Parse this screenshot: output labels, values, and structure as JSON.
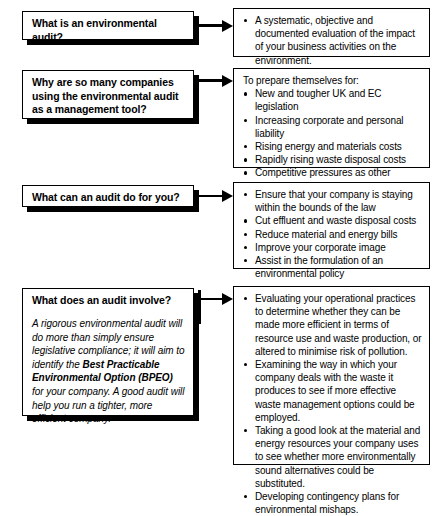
{
  "document": {
    "title": "Environmental audit question and answer flow chart",
    "background_color": "#ffffff",
    "ink_color": "#000000"
  },
  "sections": [
    {
      "id": "what-is-an-environmental-audit",
      "question": {
        "title": "What is an environmental audit?",
        "body": ""
      },
      "arrow": {
        "name": "connector-arrow-1"
      },
      "answer": {
        "lead": "",
        "items": [
          "A systematic, objective and documented evaluation of the impact of your business activities on the environment."
        ]
      }
    },
    {
      "id": "why-are-so-many-companies",
      "question": {
        "title": "Why are so many companies\nusing the environmental audit\nas a management tool?",
        "body": ""
      },
      "arrow": {
        "name": "connector-arrow-2"
      },
      "answer": {
        "lead": "To prepare themselves for:",
        "items": [
          "New and tougher UK and EC legislation",
          "Increasing corporate and personal liability",
          "Rising energy and materials costs",
          "Rapidly rising waste disposal costs",
          "Competitive pressures as other companies clean up their act",
          "Growing public pressure"
        ]
      }
    },
    {
      "id": "what-can-an-audit-do-for-you",
      "question": {
        "title": "What can an audit do for you?",
        "body": ""
      },
      "arrow": {
        "name": "connector-arrow-3"
      },
      "answer": {
        "lead": "",
        "items": [
          "Ensure that your company is staying within the bounds of the law",
          "Cut effluent and waste disposal costs",
          "Reduce material and energy bills",
          "Improve your corporate image",
          "Assist in the formulation of an environmental policy"
        ]
      }
    },
    {
      "id": "what-does-an-audit-involve",
      "question": {
        "title": "What does an audit involve?",
        "body_prefix": "A rigorous environmental audit will do more than simply ensure legislative compliance; it will aim to identify the ",
        "body_emphasis": "Best Practicable Environmental Option (BPEO)",
        "body_suffix": " for your company.  A good audit will help you run a tighter, more efficient company."
      },
      "arrow": {
        "name": "connector-arrow-4"
      },
      "answer": {
        "lead": "",
        "items": [
          "Evaluating your operational practices to determine whether they can be made more efficient in terms of resource use and waste production, or altered to minimise risk of pollution.",
          "Examining the way in which your company deals with the waste it produces to see if more effective waste management options could be employed.",
          "Taking a good look at the material and energy resources your company uses to see whether more environmentally sound alternatives could be substituted.",
          "Developing contingency plans for environmental mishaps."
        ]
      }
    }
  ]
}
